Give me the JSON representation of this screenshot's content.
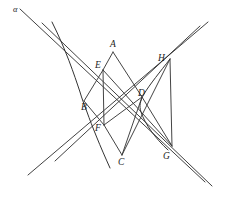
{
  "figure": {
    "background_color": "#ffffff",
    "stroke_color": "#2b2b2b",
    "width": 225,
    "height": 205,
    "labels": [
      {
        "id": "alpha",
        "text": "α",
        "x": 13,
        "y": 5,
        "greek": true
      },
      {
        "id": "A",
        "text": "A",
        "x": 110,
        "y": 40,
        "greek": false
      },
      {
        "id": "E",
        "text": "E",
        "x": 95,
        "y": 61,
        "greek": false
      },
      {
        "id": "H",
        "text": "H",
        "x": 158,
        "y": 54,
        "greek": false
      },
      {
        "id": "D",
        "text": "D",
        "x": 138,
        "y": 89,
        "greek": false
      },
      {
        "id": "B",
        "text": "B",
        "x": 81,
        "y": 103,
        "greek": false
      },
      {
        "id": "F",
        "text": "F",
        "x": 95,
        "y": 124,
        "greek": false
      },
      {
        "id": "C",
        "text": "C",
        "x": 118,
        "y": 158,
        "greek": false
      },
      {
        "id": "G",
        "text": "G",
        "x": 163,
        "y": 152,
        "greek": false
      }
    ],
    "points": {
      "A": {
        "x": 113,
        "y": 52
      },
      "B": {
        "x": 84,
        "y": 101
      },
      "C": {
        "x": 122,
        "y": 155
      },
      "D": {
        "x": 142,
        "y": 97
      },
      "E": {
        "x": 103,
        "y": 70
      },
      "F": {
        "x": 104,
        "y": 125
      },
      "G": {
        "x": 172,
        "y": 146
      },
      "H": {
        "x": 170,
        "y": 59
      }
    },
    "curves": [
      {
        "id": "left-branch",
        "kind": "hyperbola-branch",
        "path": "M 52 22 C 66 50 74 74 80 92 C 82 99 84 104 87 112 C 92 126 100 146 110 168"
      },
      {
        "id": "right-branch",
        "kind": "hyperbola-branch",
        "path": "M 170 59 C 160 72 150 84 144 94 C 140 101 139 106 141 112 C 145 124 155 138 168 150"
      }
    ],
    "asymptotes": [
      {
        "id": "asymptote-alpha",
        "x1": 20,
        "y1": 9,
        "x2": 205,
        "y2": 182
      },
      {
        "id": "asymptote-beta",
        "x1": 42,
        "y1": 23,
        "x2": 212,
        "y2": 186
      },
      {
        "id": "asymptote-gamma",
        "x1": 28,
        "y1": 175,
        "x2": 208,
        "y2": 22
      },
      {
        "id": "asymptote-delta",
        "x1": 55,
        "y1": 161,
        "x2": 200,
        "y2": 26
      }
    ],
    "chords": [
      {
        "id": "A-E",
        "from": "A",
        "to": "E"
      },
      {
        "id": "E-F",
        "from": "E",
        "to": "F"
      },
      {
        "id": "F-C",
        "from": "F",
        "to": "C"
      },
      {
        "id": "A-D",
        "from": "A",
        "to": "D"
      },
      {
        "id": "E-G",
        "from": "E",
        "to": "G"
      },
      {
        "id": "C-H",
        "from": "C",
        "to": "H"
      },
      {
        "id": "H-G",
        "from": "H",
        "to": "G"
      },
      {
        "id": "D-G",
        "from": "D",
        "to": "G"
      },
      {
        "id": "B-E",
        "from": "B",
        "to": "E"
      },
      {
        "id": "B-F",
        "from": "B",
        "to": "F"
      },
      {
        "id": "F-D",
        "from": "F",
        "to": "D"
      },
      {
        "id": "C-D",
        "from": "C",
        "to": "D"
      }
    ]
  }
}
